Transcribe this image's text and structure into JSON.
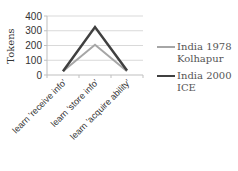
{
  "chart_data": {
    "type": "line",
    "title": "",
    "xlabel": "",
    "ylabel": "Tokens",
    "ylim": [
      0,
      400
    ],
    "yticks": [
      0,
      100,
      200,
      300,
      400
    ],
    "grid": true,
    "legend_position": "right",
    "categories": [
      "learn 'receive info'",
      "learn 'store info'",
      "learn 'acquire ability'"
    ],
    "series": [
      {
        "name": "India 1978 Kolhapur",
        "color": "#a6a6a6",
        "values": [
          25,
          205,
          25
        ]
      },
      {
        "name": "India 2000 ICE",
        "color": "#404040",
        "values": [
          25,
          325,
          30
        ]
      }
    ]
  },
  "legend": {
    "items": [
      {
        "label": "India 1978 Kolhapur",
        "color": "#a6a6a6"
      },
      {
        "label": "India 2000 ICE",
        "color": "#404040"
      }
    ]
  }
}
